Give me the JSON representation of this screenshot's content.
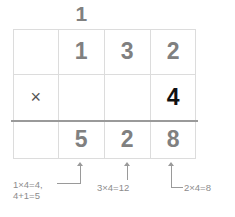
{
  "diagram": {
    "type": "long-multiplication-grid",
    "carry": {
      "value": "1",
      "column": "tens"
    },
    "grid": {
      "columns": 4,
      "rows": 3,
      "rows_data": [
        {
          "name": "multiplicand-row",
          "cells": [
            "",
            "1",
            "3",
            "2"
          ]
        },
        {
          "name": "multiplier-row",
          "cells": [
            "×",
            "",
            "",
            "4"
          ]
        },
        {
          "name": "product-row",
          "cells": [
            "",
            "5",
            "2",
            "8"
          ]
        }
      ]
    },
    "operation": {
      "multiplicand": "132",
      "operator": "×",
      "multiplier": "4",
      "product": "528"
    },
    "annotations": [
      {
        "id": "ones-step",
        "lines": [
          "2×4=8"
        ],
        "points_to_column": "ones"
      },
      {
        "id": "tens-step",
        "lines": [
          "3×4=12"
        ],
        "points_to_column": "tens"
      },
      {
        "id": "hundreds-step",
        "lines": [
          "1×4=4,",
          "4+1=5"
        ],
        "points_to_column": "hundreds"
      }
    ],
    "colors": {
      "digit_gray": "#808080",
      "digit_black": "#111111",
      "grid_line": "#dcdcdc",
      "rule": "#9a9a9a",
      "annotation_text": "#8c8c8c",
      "background": "#ffffff"
    }
  }
}
